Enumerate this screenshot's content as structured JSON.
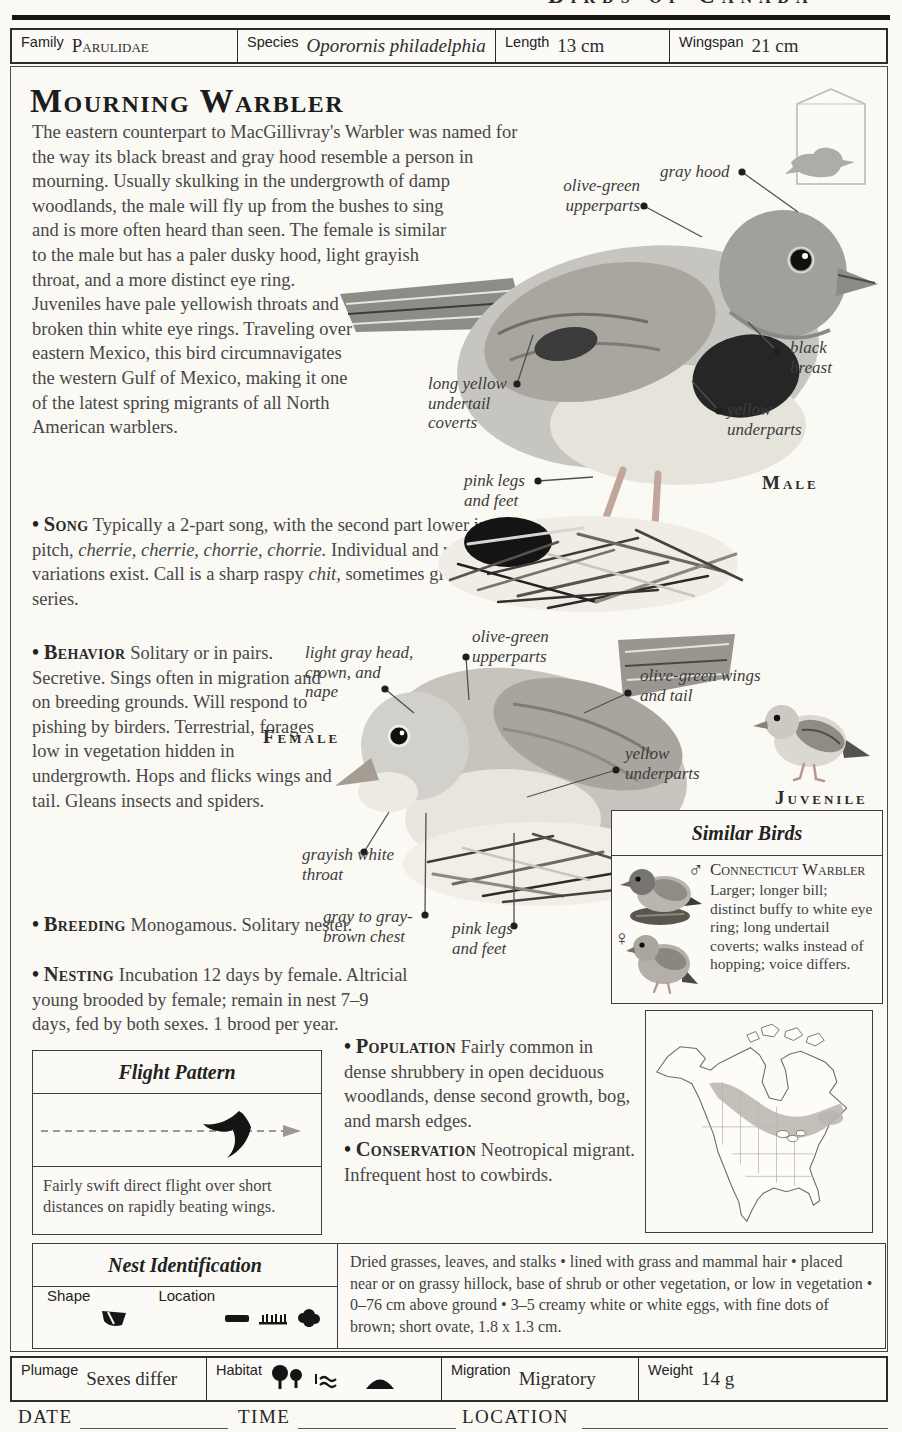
{
  "glyphs": {
    "bullet": "•"
  },
  "running_header": "Birds of Canada",
  "spec_bar": {
    "family_label": "Family",
    "family_value": "Parulidae",
    "species_label": "Species",
    "species_value": "Oporornis philadelphia",
    "length_label": "Length",
    "length_value": "13 cm",
    "wingspan_label": "Wingspan",
    "wingspan_value": "21 cm"
  },
  "title": "Mourning Warbler",
  "intro": "The eastern counterpart to MacGillivray's Warbler was named for the way its black breast and gray hood resemble a person in mourning. Usually skulking in the undergrowth of damp woodlands, the male will fly up from the bushes to sing and is more often heard than seen. The female is similar to the male but has a paler dusky hood, light grayish throat, and a more distinct eye ring. Juveniles have pale yellowish throats and broken thin white eye rings. Traveling over eastern Mexico, this bird circumnavigates the western Gulf of Mexico, making it one of the latest spring migrants of all North American warblers.",
  "sections": {
    "song": {
      "label": "Song",
      "t1": "Typically a 2-part song, with the second part lower in pitch, ",
      "i1": "cherrie, cherrie, chorrie, chorrie.",
      "t2": " Individual and regional variations exist. Call is a sharp raspy ",
      "i2": "chit,",
      "t3": " sometimes given in a series."
    },
    "behavior": {
      "label": "Behavior",
      "text": "Solitary or in pairs. Secretive. Sings often in migration and on breeding grounds. Will respond to pishing by birders. Terrestrial, forages low in vegetation hidden in undergrowth. Hops and flicks wings and tail. Gleans insects and spiders."
    },
    "breeding": {
      "label": "Breeding",
      "text": "Monogamous. Solitary nester."
    },
    "nesting": {
      "label": "Nesting",
      "text": "Incubation 12 days by female. Altricial young brooded by female; remain in nest 7–9 days, fed by both sexes. 1 brood per year."
    },
    "population": {
      "label": "Population",
      "text": "Fairly common in dense shrubbery in open deciduous woodlands, dense second growth, bog, and marsh edges."
    },
    "conservation": {
      "label": "Conservation",
      "text": "Neotropical migrant. Infrequent host to cowbirds."
    }
  },
  "male": {
    "caption": "Male",
    "labels": {
      "gray_hood": "gray hood",
      "upperparts": "olive-green upperparts",
      "black_breast": "black breast",
      "yellow_underparts": "yellow underparts",
      "undertail": "long yellow undertail coverts",
      "legs": "pink legs and feet"
    }
  },
  "female": {
    "caption": "Female",
    "labels": {
      "head": "light gray head, crown, and nape",
      "upperparts": "olive-green upperparts",
      "wings_tail": "olive-green wings and tail",
      "underparts": "yellow underparts",
      "throat": "grayish white throat",
      "chest": "gray to gray-brown chest",
      "legs": "pink legs and feet"
    }
  },
  "juvenile": {
    "caption": "Juvenile"
  },
  "similar_birds": {
    "title": "Similar Birds",
    "male_symbol": "♂",
    "female_symbol": "♀",
    "species_name": "Connecticut Warbler",
    "description": "Larger; longer bill; distinct buffy to white eye ring; long undertail coverts; walks instead of hopping; voice differs."
  },
  "flight_pattern": {
    "title": "Flight Pattern",
    "description": "Fairly swift direct flight over short distances on rapidly beating wings."
  },
  "nest_identification": {
    "title": "Nest Identification",
    "shape_label": "Shape",
    "location_label": "Location",
    "description": "Dried grasses, leaves, and stalks • lined with grass and mammal hair • placed near or on grassy hillock, base of shrub or other vegetation, or low in vegetation • 0–76 cm above ground • 3–5 creamy white or white eggs, with fine dots of brown; short ovate, 1.8 x 1.3 cm."
  },
  "bottom_bar": {
    "plumage_label": "Plumage",
    "plumage_value": "Sexes differ",
    "habitat_label": "Habitat",
    "migration_label": "Migration",
    "migration_value": "Migratory",
    "weight_label": "Weight",
    "weight_value": "14 g"
  },
  "log_line": {
    "date_label": "DATE",
    "time_label": "TIME",
    "location_label": "LOCATION"
  }
}
